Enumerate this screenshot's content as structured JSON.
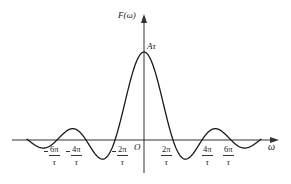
{
  "chart_data": {
    "type": "line",
    "title": "",
    "function": "F(ω) = Aτ · sinc(ωτ/2)",
    "xlabel": "ω",
    "ylabel": "F(ω)",
    "origin_label": "O",
    "peak_label": "Aτ",
    "x_tick_labels": [
      "-6π/τ",
      "-4π/τ",
      "-2π/τ",
      "2π/τ",
      "4π/τ",
      "6π/τ"
    ],
    "x_ticks_in_units_of_pi_over_tau": [
      -6,
      -4,
      -2,
      2,
      4,
      6
    ],
    "zero_crossings_in_units_of_pi_over_tau": [
      -6,
      -4,
      -2,
      2,
      4,
      6
    ],
    "peak": {
      "x": 0,
      "y": 1.0,
      "label": "Aτ"
    },
    "sample_points_normalized": {
      "x_in_units_of_pi_over_tau": [
        -8,
        -7,
        -6,
        -5,
        -4,
        -3,
        -2,
        -1,
        0,
        1,
        2,
        3,
        4,
        5,
        6,
        7,
        8
      ],
      "y_over_A_tau": [
        0,
        -0.091,
        0,
        0.127,
        0,
        -0.212,
        0,
        0.637,
        1.0,
        0.637,
        0,
        -0.212,
        0,
        0.127,
        0,
        -0.091,
        0
      ]
    },
    "grid": false,
    "legend": null
  },
  "labels": {
    "y_axis": "F(ω)",
    "x_axis": "ω",
    "origin": "O",
    "peak": "Aτ",
    "ticks": [
      {
        "num": "6π",
        "den": "τ",
        "negative": true
      },
      {
        "num": "4π",
        "den": "τ",
        "negative": true
      },
      {
        "num": "2π",
        "den": "τ",
        "negative": true
      },
      {
        "num": "2π",
        "den": "τ",
        "negative": false
      },
      {
        "num": "4π",
        "den": "τ",
        "negative": false
      },
      {
        "num": "6π",
        "den": "τ",
        "negative": false
      }
    ]
  },
  "style": {
    "line_color": "#1a1a1a",
    "axis_color": "#333333"
  }
}
